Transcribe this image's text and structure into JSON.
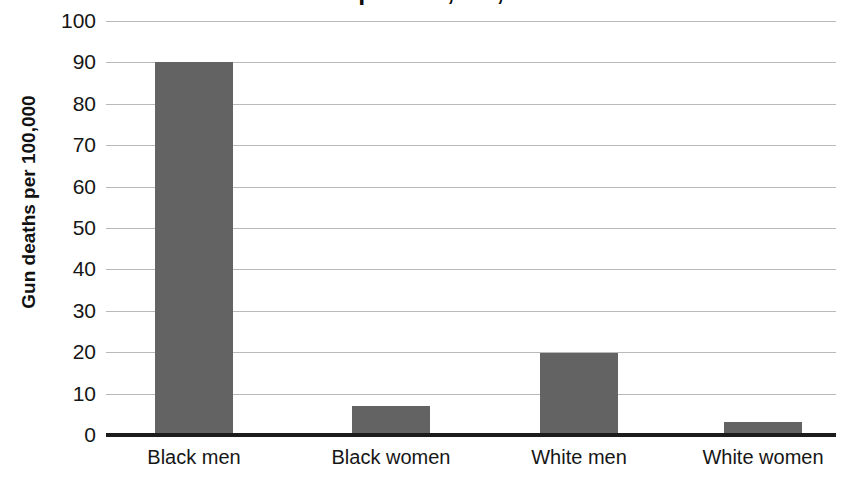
{
  "chart_data": {
    "type": "bar",
    "title": "Gun deaths per 100,000, 2012-2014",
    "categories": [
      "Black men",
      "Black women",
      "White men",
      "White women"
    ],
    "values": [
      90,
      7,
      19.7,
      3.1
    ],
    "series": [
      {
        "name": "Gun deaths per 100,000",
        "values": [
          90,
          7,
          19.7,
          3.1
        ]
      }
    ],
    "xlabel": "",
    "ylabel": "Gun deaths per 100,000",
    "ylim": [
      0,
      100
    ],
    "ytick_step": 10,
    "yticks": [
      100,
      90,
      80,
      70,
      60,
      50,
      40,
      30,
      20,
      10,
      0
    ],
    "ytick_labels": [
      "100",
      "90",
      "80",
      "70",
      "60",
      "50",
      "40",
      "30",
      "20",
      "10",
      "0"
    ],
    "grid": true,
    "grid_axis": "y",
    "legend": false,
    "legend_position": "none",
    "bar_color": "#636363",
    "gridline_color": "#b9b9b9",
    "axis_color": "#1c1c1c",
    "background_color": "#ffffff",
    "title_clipped": true
  }
}
